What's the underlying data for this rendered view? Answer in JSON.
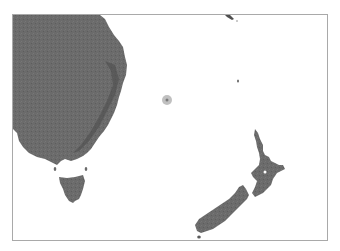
{
  "map": {
    "type": "shaded-relief",
    "region": "Tasman Sea",
    "colors": {
      "background": "#ffffff",
      "land": "#6b6b6b",
      "land_shadow": "#4a4a4a",
      "frame": "#a9a9a9",
      "marker_outer": "#b5b5b5",
      "marker_inner": "#7a7a7a"
    },
    "landmasses": [
      {
        "name": "australia-east-coast"
      },
      {
        "name": "tasmania"
      },
      {
        "name": "new-zealand-north-island"
      },
      {
        "name": "new-zealand-south-island"
      },
      {
        "name": "stewart-island"
      },
      {
        "name": "norfolk-island"
      },
      {
        "name": "new-caledonia-tip"
      },
      {
        "name": "bass-strait-islands"
      }
    ],
    "marker": {
      "x": 166,
      "y": 99
    }
  }
}
